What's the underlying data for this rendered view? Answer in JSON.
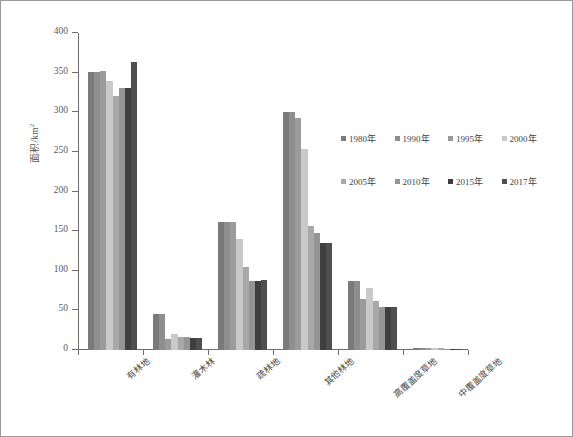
{
  "chart_data": {
    "type": "bar",
    "title": "",
    "xlabel": "",
    "ylabel": "面积/km²",
    "ylim": [
      0,
      400
    ],
    "ytick_step": 50,
    "yticks": [
      "400",
      "350",
      "300",
      "250",
      "200",
      "150",
      "100",
      "50",
      "0"
    ],
    "grid": false,
    "legend_position": "center-right",
    "orientation": "vertical",
    "grouped": true,
    "categories": [
      "有林地",
      "灌木林",
      "疏林地",
      "其他林地",
      "高覆盖度草地",
      "中覆盖度草地"
    ],
    "series": [
      {
        "name": "1980年",
        "color": "#7a7a7a",
        "values": [
          351,
          45,
          162,
          300,
          87,
          3
        ]
      },
      {
        "name": "1990年",
        "color": "#8e8e8e",
        "values": [
          351,
          45,
          162,
          300,
          87,
          3
        ]
      },
      {
        "name": "1995年",
        "color": "#9b9b9b",
        "values": [
          352,
          14,
          161,
          293,
          65,
          3
        ]
      },
      {
        "name": "2000年",
        "color": "#c9c9c9",
        "values": [
          339,
          20,
          140,
          254,
          78,
          3
        ]
      },
      {
        "name": "2005年",
        "color": "#a8a8a8",
        "values": [
          321,
          16,
          105,
          156,
          62,
          2
        ]
      },
      {
        "name": "2010年",
        "color": "#959595",
        "values": [
          331,
          16,
          87,
          148,
          54,
          1
        ]
      },
      {
        "name": "2015年",
        "color": "#3f3f3f",
        "values": [
          330,
          15,
          87,
          135,
          54,
          1
        ]
      },
      {
        "name": "2017年",
        "color": "#4f4f4f",
        "values": [
          364,
          15,
          88,
          135,
          54,
          1
        ]
      }
    ]
  },
  "axis": {
    "y_title": "面积/km",
    "y_title_sup": "2"
  }
}
